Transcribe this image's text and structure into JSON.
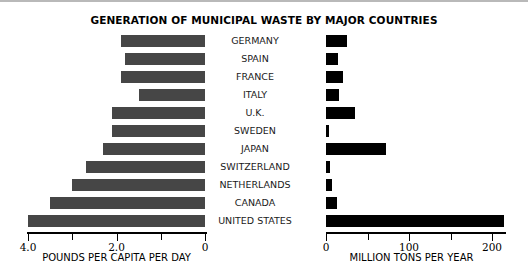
{
  "chart_data": {
    "type": "bar",
    "title": "GENERATION OF MUNICIPAL WASTE BY MAJOR COUNTRIES",
    "orientation": "horizontal",
    "grid": false,
    "legend": null,
    "categories": [
      "GERMANY",
      "SPAIN",
      "FRANCE",
      "ITALY",
      "U.K.",
      "SWEDEN",
      "JAPAN",
      "SWITZERLAND",
      "NETHERLANDS",
      "CANADA",
      "UNITED STATES"
    ],
    "panels": [
      {
        "id": "left",
        "xlabel": "POUNDS PER CAPITA PER DAY",
        "direction": "right-to-left",
        "xlim": [
          0,
          4.3
        ],
        "axis_max_label": 4.0,
        "major_ticks": [
          4.0,
          2.0,
          0
        ],
        "major_tick_labels": [
          "4.0",
          "2.0",
          "0"
        ],
        "minor_ticks": [
          3.0,
          1.0
        ],
        "values": [
          1.9,
          1.8,
          1.9,
          1.5,
          2.1,
          2.1,
          2.3,
          2.7,
          3.0,
          3.5,
          4.0
        ]
      },
      {
        "id": "right",
        "xlabel": "MILLION TONS PER YEAR",
        "direction": "left-to-right",
        "xlim": [
          0,
          220
        ],
        "major_ticks": [
          0,
          100,
          200
        ],
        "major_tick_labels": [
          "0",
          "100",
          "200"
        ],
        "minor_ticks": [
          50,
          150
        ],
        "values": [
          25,
          14,
          21,
          16,
          35,
          3,
          72,
          5,
          7,
          13,
          215
        ]
      }
    ],
    "colors": {
      "left_bar": "#464646",
      "right_bar": "#000000",
      "axis": "#000000",
      "text": "#000000",
      "background": "#ffffff"
    }
  }
}
